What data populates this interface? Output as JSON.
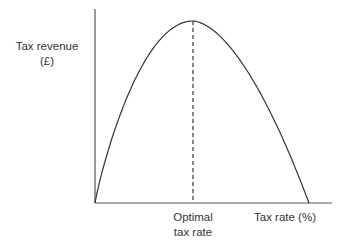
{
  "chart_data": {
    "type": "line",
    "title": "",
    "xlabel": "Tax rate (%)",
    "ylabel": "Tax revenue (£)",
    "ylabel_lines": [
      "Tax revenue",
      "(£)"
    ],
    "x": [
      0,
      10,
      20,
      30,
      40,
      45.8,
      50,
      60,
      70,
      80,
      90,
      100
    ],
    "series": [
      {
        "name": "Laffer curve",
        "values": [
          0,
          36,
          65,
          86,
          98,
          100,
          99,
          88,
          68,
          40,
          20,
          0
        ]
      }
    ],
    "xlim": [
      0,
      100
    ],
    "ylim": [
      0,
      100
    ],
    "annotation": {
      "label_lines": [
        "Optimal",
        "tax rate"
      ],
      "x": 45.8,
      "style": "dashed vertical line"
    },
    "grid": false,
    "legend": "none"
  },
  "colors": {
    "line": "#333333",
    "axis": "#555555"
  }
}
